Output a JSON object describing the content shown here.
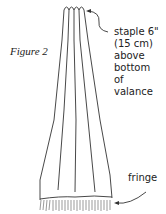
{
  "figure": {
    "caption": "Figure 2",
    "labels": {
      "staple_line1": "staple 6\"",
      "staple_line2": "(15 cm)",
      "staple_line3": "above",
      "staple_line4": "bottom",
      "staple_line5": "of",
      "staple_line6": "valance",
      "fringe": "fringe"
    },
    "colors": {
      "line": "#333333",
      "background": "#ffffff"
    }
  }
}
